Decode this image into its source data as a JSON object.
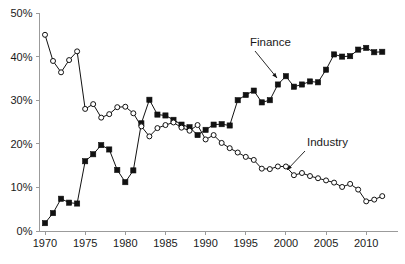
{
  "chart_data": {
    "type": "line",
    "title": "",
    "subtitle": "",
    "xlabel": "",
    "ylabel": "",
    "xlim": [
      1969.5,
      2012.5
    ],
    "ylim": [
      0,
      50
    ],
    "grid": false,
    "legend_position": "inline-annotations",
    "x_tick_labels": [
      "1970",
      "1975",
      "1980",
      "1985",
      "1990",
      "1995",
      "2000",
      "2005",
      "2010"
    ],
    "x_ticks": [
      1970,
      1975,
      1980,
      1985,
      1990,
      1995,
      2000,
      2005,
      2010
    ],
    "y_tick_labels": [
      "0%",
      "10%",
      "20%",
      "30%",
      "40%",
      "50%"
    ],
    "y_ticks": [
      0,
      10,
      20,
      30,
      40,
      50
    ],
    "x": [
      1970,
      1971,
      1972,
      1973,
      1974,
      1975,
      1976,
      1977,
      1978,
      1979,
      1980,
      1981,
      1982,
      1983,
      1984,
      1985,
      1986,
      1987,
      1988,
      1989,
      1990,
      1991,
      1992,
      1993,
      1994,
      1995,
      1996,
      1997,
      1998,
      1999,
      2000,
      2001,
      2002,
      2003,
      2004,
      2005,
      2006,
      2007,
      2008,
      2009,
      2010,
      2011,
      2012
    ],
    "series": [
      {
        "name": "Finance",
        "marker": "filled-square",
        "values": [
          1.8,
          4.1,
          7.4,
          6.5,
          6.3,
          16.0,
          17.6,
          19.7,
          18.7,
          14.0,
          11.2,
          13.9,
          24.7,
          30.1,
          26.7,
          26.5,
          25.5,
          24.4,
          23.8,
          22.0,
          23.2,
          24.4,
          24.5,
          24.2,
          30.0,
          31.2,
          32.2,
          29.5,
          30.0,
          33.6,
          35.5,
          33.1,
          33.6,
          34.3,
          34.1,
          37.0,
          40.5,
          40.0,
          40.1,
          41.6,
          42.0,
          41.0,
          41.1
        ]
      },
      {
        "name": "Industry",
        "marker": "open-circle",
        "values": [
          45.0,
          39.0,
          36.4,
          39.2,
          41.2,
          28.0,
          29.1,
          26.0,
          26.8,
          28.4,
          28.5,
          27.0,
          24.0,
          21.7,
          23.6,
          24.3,
          24.9,
          23.7,
          23.0,
          24.3,
          21.0,
          22.0,
          20.2,
          19.0,
          18.0,
          17.0,
          16.3,
          14.3,
          14.2,
          14.8,
          14.8,
          12.8,
          13.3,
          12.6,
          12.1,
          11.6,
          11.1,
          10.1,
          10.8,
          9.5,
          6.8,
          7.2,
          8.0
        ]
      }
    ],
    "annotations": [
      {
        "label": "Finance",
        "text_x": 250,
        "text_y": 46,
        "arrow_from_x": 255,
        "arrow_from_y": 51,
        "arrow_to_x": 277,
        "arrow_to_y": 78
      },
      {
        "label": "Industry",
        "text_x": 307,
        "text_y": 146,
        "arrow_from_x": 305,
        "arrow_from_y": 151,
        "arrow_to_x": 287,
        "arrow_to_y": 170
      }
    ]
  },
  "colors": {
    "background": "#ffffff",
    "line": "#111111",
    "axis": "#9b9b9b",
    "text": "#1a1a1a"
  }
}
